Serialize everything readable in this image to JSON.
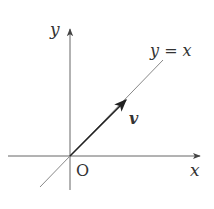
{
  "diagram": {
    "axes": {
      "x_label": "x",
      "y_label": "y",
      "origin_label": "O"
    },
    "line": {
      "label": "y = x"
    },
    "vector": {
      "label": "v"
    },
    "colors": {
      "axis": "#555555",
      "line": "#777777",
      "vector": "#222222",
      "text": "#333333"
    }
  }
}
